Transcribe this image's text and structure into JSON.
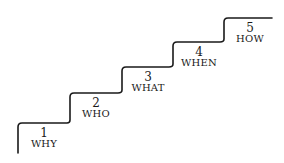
{
  "diagram": {
    "type": "staircase",
    "line_color": "#1a1a1a",
    "steps": [
      {
        "number": "1",
        "label": "WHY"
      },
      {
        "number": "2",
        "label": "WHO"
      },
      {
        "number": "3",
        "label": "WHAT"
      },
      {
        "number": "4",
        "label": "WHEN"
      },
      {
        "number": "5",
        "label": "HOW"
      }
    ]
  }
}
